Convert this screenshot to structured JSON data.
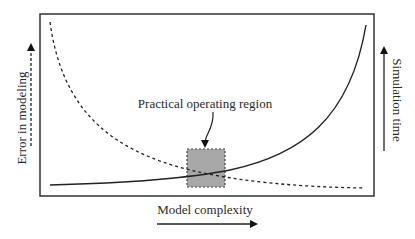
{
  "diagram": {
    "labels": {
      "y_left": "Error in modeling",
      "y_right": "Simulation time",
      "x": "Model complexity",
      "annotation": "Practical operating region"
    },
    "curves": [
      {
        "name": "error-in-modeling",
        "style": "dashed",
        "trend": "decreasing"
      },
      {
        "name": "simulation-time",
        "style": "solid",
        "trend": "increasing"
      }
    ],
    "highlight": {
      "name": "practical-operating-region",
      "fill": "#a8a8a8",
      "border": "dashed"
    }
  }
}
